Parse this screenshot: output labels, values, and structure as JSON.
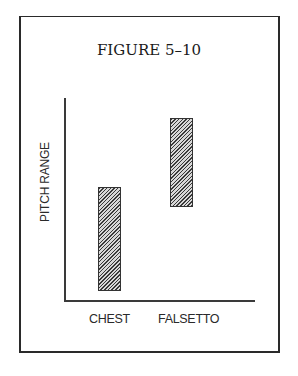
{
  "figure": {
    "title": "FIGURE 5–10"
  },
  "chart_data": {
    "type": "bar",
    "subtype": "floating-range",
    "title": "FIGURE 5–10",
    "xlabel": "",
    "ylabel": "PITCH RANGE",
    "categories": [
      "CHEST",
      "FALSETTO"
    ],
    "series": [
      {
        "name": "Pitch range",
        "ranges": [
          {
            "category": "CHEST",
            "low": 0.05,
            "high": 0.56
          },
          {
            "category": "FALSETTO",
            "low": 0.46,
            "high": 0.9
          }
        ]
      }
    ],
    "ylim": [
      0,
      1
    ],
    "y_ticks": [],
    "grid": false,
    "legend": null,
    "fill_pattern": "diagonal-hatch"
  },
  "axes": {
    "ylabel": "PITCH RANGE",
    "xlabels": [
      "CHEST",
      "FALSETTO"
    ]
  }
}
